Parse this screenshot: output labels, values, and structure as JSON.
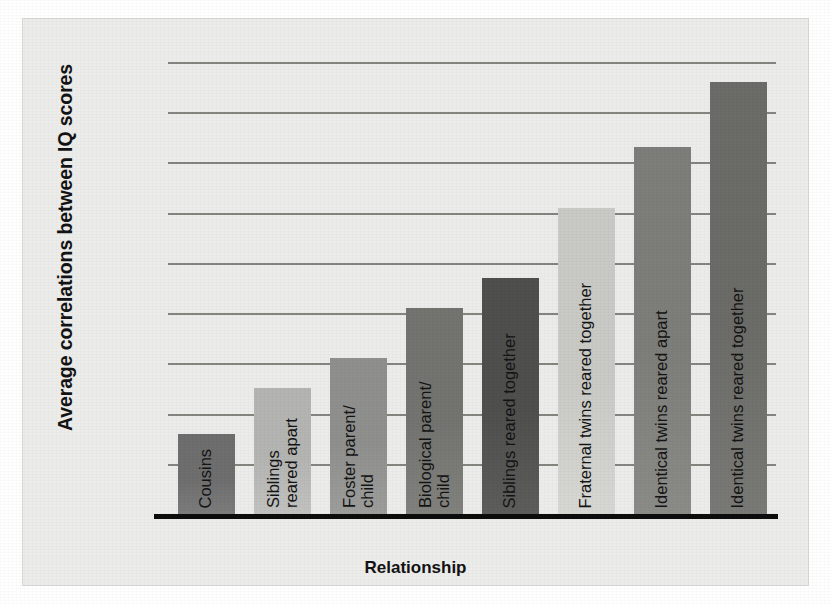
{
  "chart_data": {
    "type": "bar",
    "title": "",
    "xlabel": "Relationship",
    "ylabel": "Average correlations between IQ scores",
    "categories": [
      "Cousins",
      "Siblings\nreared apart",
      "Foster parent/\nchild",
      "Biological parent/\nchild",
      "Siblings reared together",
      "Fraternal twins reared together",
      "Identical twins reared apart",
      "Identical twins reared together"
    ],
    "values": [
      0.16,
      0.25,
      0.31,
      0.41,
      0.47,
      0.61,
      0.73,
      0.86
    ],
    "ylim": [
      0.0,
      0.9
    ],
    "yticks": [
      ".00",
      ".10",
      ".20",
      ".30",
      ".40",
      ".50",
      ".60",
      ".70",
      ".80",
      ".90"
    ],
    "ytick_values": [
      0.0,
      0.1,
      0.2,
      0.3,
      0.4,
      0.5,
      0.6,
      0.7,
      0.8,
      0.9
    ],
    "grid": true,
    "legend": "none",
    "bar_colors": [
      "#6e6e6e",
      "#b4b4b2",
      "#8f8f8d",
      "#73736f",
      "#4f4f4d",
      "#c9c9c6",
      "#7d7d79",
      "#6b6b67"
    ],
    "grid_color": "#85857f",
    "axis_color": "#0d0d0d",
    "panel_color": "#ececeb",
    "plot_color": "#f4f4f2"
  },
  "axes": {
    "y_title": "Average correlations between IQ scores",
    "x_title": "Relationship"
  }
}
